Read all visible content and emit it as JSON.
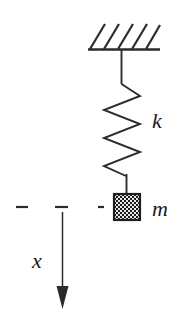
{
  "figure": {
    "kind": "mass-spring-diagram",
    "background_color": "#ffffff",
    "ink_color": "#2b2b2b"
  },
  "labels": {
    "spring_constant": "k",
    "mass": "m",
    "displacement": "x"
  },
  "parts": {
    "ceiling": {
      "name": "fixed-support",
      "hatch_count": 5,
      "bar_x1": 88,
      "bar_x2": 160,
      "bar_y": 49
    },
    "rod": {
      "name": "upper-connector-rod",
      "x": 121,
      "y1": 49,
      "y2": 83
    },
    "spring": {
      "name": "coil-spring",
      "coil_count": 4,
      "left_x": 104,
      "right_x": 140,
      "top_y": 83,
      "bottom_y": 170
    },
    "lower_rod": {
      "name": "lower-connector-rod",
      "x": 126,
      "y1": 170,
      "y2": 194
    },
    "mass_block": {
      "name": "mass-block",
      "x": 114,
      "y": 194,
      "width": 26,
      "height": 26,
      "fill_pattern": "checker"
    },
    "equilibrium_line": {
      "name": "equilibrium-reference-line",
      "y": 207,
      "dashes": [
        {
          "x1": 16,
          "x2": 28
        },
        {
          "x1": 55,
          "x2": 68
        },
        {
          "x1": 98,
          "x2": 104
        }
      ]
    },
    "displacement_arrow": {
      "name": "displacement-arrow",
      "x": 62,
      "y_start": 212,
      "y_end": 308,
      "direction": "down"
    }
  },
  "label_positions": {
    "k": {
      "x": 152,
      "y": 128
    },
    "m": {
      "x": 152,
      "y": 216
    },
    "x": {
      "x": 32,
      "y": 268
    }
  }
}
